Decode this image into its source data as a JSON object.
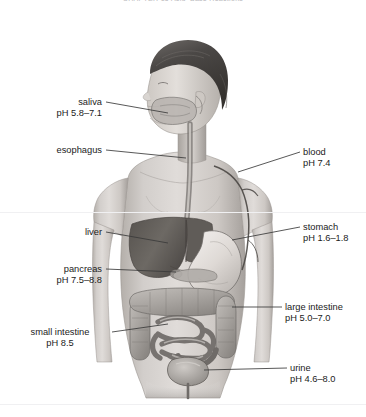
{
  "running_head": "CHAPTER 15  Acid–Base Reactions",
  "figure": {
    "style": "grayscale pencil rendering of a human torso with internal organs"
  },
  "colors": {
    "background": "#ffffff",
    "label_text": "#1b1b1b",
    "leader_line": "#3a3a3a",
    "running_head": "#b9b9bd",
    "skin_light": "#d9d6d2",
    "skin_mid": "#bdb8b3",
    "skin_dark": "#8e8a86",
    "hair_dark": "#3f3d3c",
    "organ_liver": "#6b6763",
    "organ_stomach": "#e2dedb",
    "organ_intestine": "#a9a5a1"
  },
  "labels": [
    {
      "id": "saliva",
      "name": "saliva",
      "ph": "pH 5.8–7.1",
      "align": "right",
      "x": 24,
      "y": 97,
      "width": 78,
      "leader": {
        "x1": 106,
        "y1": 102,
        "x2": 168,
        "y2": 113
      }
    },
    {
      "id": "esophagus",
      "name": "esophagus",
      "ph": "",
      "align": "right",
      "x": 16,
      "y": 145,
      "width": 86,
      "leader": {
        "x1": 106,
        "y1": 150,
        "x2": 186,
        "y2": 158
      }
    },
    {
      "id": "blood",
      "name": "blood",
      "ph": "pH 7.4",
      "align": "left",
      "x": 303,
      "y": 147,
      "width": 60,
      "leader": {
        "x1": 300,
        "y1": 152,
        "x2": 238,
        "y2": 172
      }
    },
    {
      "id": "liver",
      "name": "liver",
      "ph": "",
      "align": "right",
      "x": 36,
      "y": 227,
      "width": 66,
      "leader": {
        "x1": 106,
        "y1": 232,
        "x2": 168,
        "y2": 243
      }
    },
    {
      "id": "stomach",
      "name": "stomach",
      "ph": "pH 1.6–1.8",
      "align": "left",
      "x": 303,
      "y": 222,
      "width": 62,
      "leader": {
        "x1": 300,
        "y1": 227,
        "x2": 232,
        "y2": 240
      }
    },
    {
      "id": "pancreas",
      "name": "pancreas",
      "ph": "pH 7.5–8.8",
      "align": "right",
      "x": 22,
      "y": 264,
      "width": 80,
      "leader": {
        "x1": 106,
        "y1": 269,
        "x2": 176,
        "y2": 272
      }
    },
    {
      "id": "large-intestine",
      "name": "large intestine",
      "ph": "pH 5.0–7.0",
      "align": "left",
      "x": 285,
      "y": 302,
      "width": 80,
      "leader": {
        "x1": 282,
        "y1": 307,
        "x2": 232,
        "y2": 307
      }
    },
    {
      "id": "small-intestine",
      "name": "small intestine",
      "ph": "pH 8.5",
      "align": "center",
      "x": 12,
      "y": 327,
      "width": 96,
      "leader": {
        "x1": 112,
        "y1": 332,
        "x2": 168,
        "y2": 324
      }
    },
    {
      "id": "urine",
      "name": "urine",
      "ph": "pH 4.6–8.0",
      "align": "left",
      "x": 290,
      "y": 363,
      "width": 72,
      "leader": {
        "x1": 287,
        "y1": 368,
        "x2": 204,
        "y2": 370
      }
    }
  ]
}
